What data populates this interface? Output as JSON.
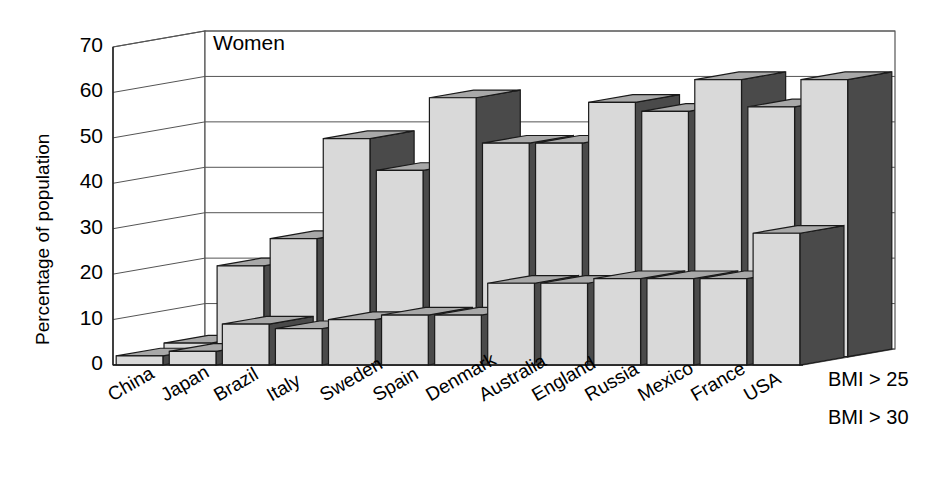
{
  "chart_data": {
    "type": "bar",
    "title": "Women",
    "xlabel": "",
    "ylabel": "Percentage of population",
    "ylim": [
      0,
      70
    ],
    "yticks": [
      0,
      10,
      20,
      30,
      40,
      50,
      60,
      70
    ],
    "grid": true,
    "legend_position": "right",
    "three_d": true,
    "categories": [
      "China",
      "Japan",
      "Brazil",
      "Italy",
      "Sweden",
      "Spain",
      "Denmark",
      "Australia",
      "England",
      "Russia",
      "Mexico",
      "France",
      "USA"
    ],
    "series": [
      {
        "name": "BMI > 25",
        "values": [
          3,
          20,
          26,
          48,
          41,
          57,
          47,
          47,
          56,
          54,
          61,
          55,
          61
        ]
      },
      {
        "name": "BMI > 30",
        "values": [
          2,
          3,
          9,
          8,
          10,
          11,
          11,
          18,
          18,
          19,
          19,
          19,
          29
        ]
      }
    ]
  },
  "axis": {
    "y_title": "Percentage of population",
    "tick_labels": [
      "70",
      "60",
      "50",
      "40",
      "30",
      "20",
      "10",
      "0"
    ]
  },
  "legend": {
    "items": [
      "BMI > 25",
      "BMI > 30"
    ]
  },
  "panel": {
    "title": "Women"
  },
  "colors": {
    "bar_front_light": "#d9d9d9",
    "bar_top_mid": "#a8a8a8",
    "bar_side_dark": "#4a4a4a",
    "outline": "#1a1a1a",
    "grid": "#555555",
    "text": "#000000",
    "background": "#ffffff"
  }
}
